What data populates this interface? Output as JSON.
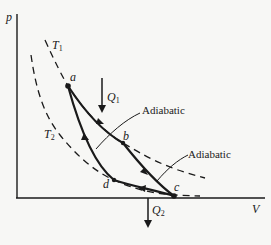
{
  "diagram": {
    "axes": {
      "y_label": "p",
      "x_label": "V"
    },
    "isotherms": [
      {
        "label": "T",
        "subscript": "1"
      },
      {
        "label": "T",
        "subscript": "2"
      }
    ],
    "points": [
      {
        "id": "a",
        "label": "a"
      },
      {
        "id": "b",
        "label": "b"
      },
      {
        "id": "c",
        "label": "c"
      },
      {
        "id": "d",
        "label": "d"
      }
    ],
    "heat": {
      "in": {
        "label": "Q",
        "subscript": "1"
      },
      "out": {
        "label": "Q",
        "subscript": "2"
      }
    },
    "annotations": [
      {
        "id": "adiabatic-1",
        "text": "Adiabatic"
      },
      {
        "id": "adiabatic-2",
        "text": "Adiabatic"
      }
    ],
    "colors": {
      "ink": "#1a1a1a",
      "background": "#f7f7f5"
    }
  }
}
